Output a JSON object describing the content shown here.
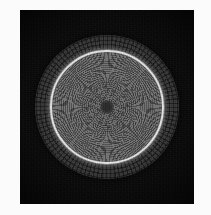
{
  "figure": {
    "domain": "Natural-Image",
    "kind": "grayscale-scientific-figure",
    "description": "Circular radial mesh disk on a black field",
    "canvas": {
      "width": 211,
      "height": 215,
      "margin_color": "#fbfbfb"
    },
    "panel": {
      "name": "dark-image-panel",
      "x": 20,
      "y": 10,
      "width": 174,
      "height": 194,
      "background_color": "#0d0d0d"
    },
    "disk": {
      "center_x": 87,
      "center_y": 97,
      "outer_radius": 72,
      "ring_radius": 55,
      "outer_band_color": "#8d8d8d",
      "bright_ring_color": "#ececec",
      "inner_disk_color": "#6f6f6f",
      "center_point_color": "#242424",
      "center_point_radius": 7
    },
    "mesh": {
      "outer_band_label": "coarse quadrilateral mesh",
      "outer_band_ring_count": 3,
      "outer_band_spoke_spacing_deg": 3.6,
      "inner_disk_label": "fine radial-concentric mesh",
      "inner_spoke_spacing_deg": 1.5
    }
  }
}
